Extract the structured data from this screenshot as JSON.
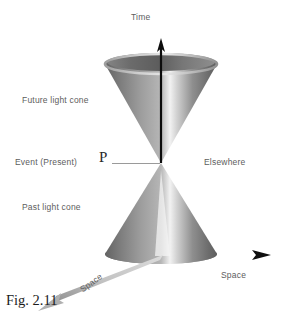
{
  "figure": {
    "caption": "Fig. 2.11",
    "background_color": "#ffffff"
  },
  "labels": {
    "time": "Time",
    "future_light_cone": "Future light cone",
    "event_present": "Event (Present)",
    "event_point": "P",
    "elsewhere": "Elsewhere",
    "past_light_cone": "Past light cone",
    "space_horizontal": "Space",
    "space_diagonal": "Space"
  },
  "colors": {
    "label_text": "#5d5d5d",
    "caption_text": "#1c1c1c",
    "axis_dark": "#111111",
    "cone_dark": "#6f6f6f",
    "cone_mid": "#9a9a9a",
    "cone_light": "#efefef",
    "rim_dark": "#4a4a4a",
    "leader_line": "#8c8c8c",
    "diagonal_arrow": "#b9b9b9"
  },
  "geometry": {
    "apex_x": 161,
    "apex_y": 163,
    "cone_half_width": 56,
    "top_rim_y": 64,
    "bottom_rim_y": 254,
    "rim_ry": 10
  }
}
